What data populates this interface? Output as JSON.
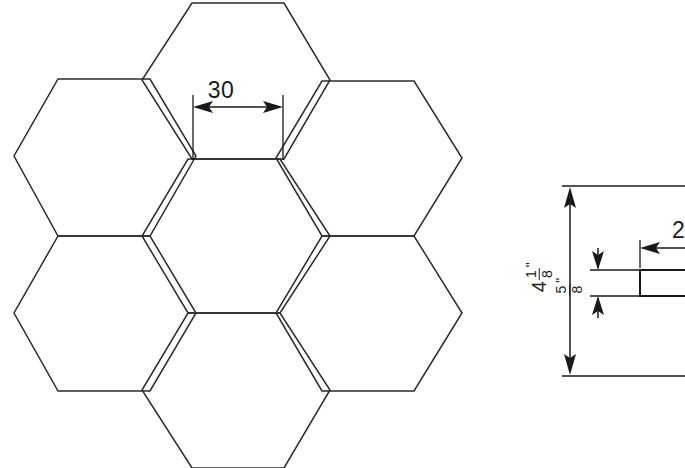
{
  "drawing": {
    "background_color": "#ffffff",
    "line_color": "#2b2b2b",
    "dimension_color": "#1a1a1a",
    "width": 685,
    "height": 468,
    "title": "Hexagonal honeycomb tile layout with side profile detail"
  },
  "plan_view": {
    "name": "hexagon-cluster",
    "shape": "hexagon",
    "orientation": "flat-top",
    "count": 7,
    "arrangement": "center hexagon surrounded by six hexagons",
    "dimension": {
      "label": "30",
      "value": 30,
      "measures": "flat edge width across top of center hexagon",
      "arrow_style": "double-ended inward arrows"
    }
  },
  "detail_view": {
    "name": "side-profile-detail",
    "note": "cropped at right image edge",
    "overall_height": {
      "whole": "4",
      "numerator": "1",
      "denominator": "8",
      "unit": "\"",
      "full_label": "4 1/8\""
    },
    "thickness": {
      "whole": "",
      "numerator": "5",
      "denominator": "8",
      "unit": "\"",
      "full_label": "5/8\""
    },
    "partial_dimension": {
      "label": "2",
      "note": "truncated by image edge"
    }
  }
}
